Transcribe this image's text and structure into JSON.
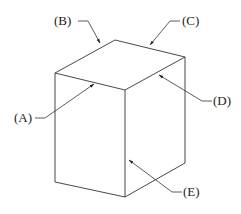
{
  "diagram": {
    "type": "isometric-box-with-callouts",
    "labels": {
      "A": "(A)",
      "B": "(B)",
      "C": "(C)",
      "D": "(D)",
      "E": "(E)"
    },
    "colors": {
      "line": "#333333",
      "background": "#ffffff"
    }
  }
}
